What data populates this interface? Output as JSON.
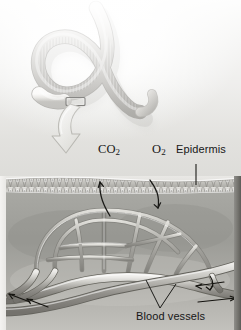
{
  "figure": {
    "panels": {
      "top": "whole earthworm photograph",
      "bottom": "magnified cross-section of body wall"
    }
  },
  "labels": {
    "co2": {
      "text": "CO",
      "subscript": "2",
      "full": "CO2"
    },
    "o2": {
      "text": "O",
      "subscript": "2",
      "full": "O2"
    },
    "epidermis": {
      "text": "Epidermis"
    },
    "blood_vessels": {
      "text": "Blood vessels"
    }
  },
  "icons": {
    "callout_box": "magnification-box-icon",
    "callout_arrow": "curved-arrow-icon",
    "co2_arrow": "outward-diffusion-arrow-icon",
    "o2_arrow": "inward-diffusion-arrow-icon",
    "epidermis_leader": "leader-line-icon",
    "blood_vessels_leader": "v-leader-line-icon",
    "flow_arrows": "blood-flow-direction-arrow-icon"
  },
  "structures": {
    "worm": {
      "name": "earthworm body",
      "features": [
        "segments",
        "clitellum"
      ]
    },
    "epidermis_layer": {
      "name": "epidermis cell layer",
      "cell_count": 34
    },
    "capillary_network": {
      "name": "capillary bed"
    },
    "major_vessels": {
      "name": "dorsal and ventral blood vessels",
      "count": 2
    }
  },
  "colors": {
    "background": "#f2f1ef",
    "tissue": "#9a9a96",
    "epidermis": "#cfcfca",
    "vessel": "#8d8d88",
    "vessel_highlight": "#d8d8d3",
    "label_text": "#171717",
    "plate_edge": "#5d5c58",
    "callout_arrow": "#f5f5f2"
  }
}
